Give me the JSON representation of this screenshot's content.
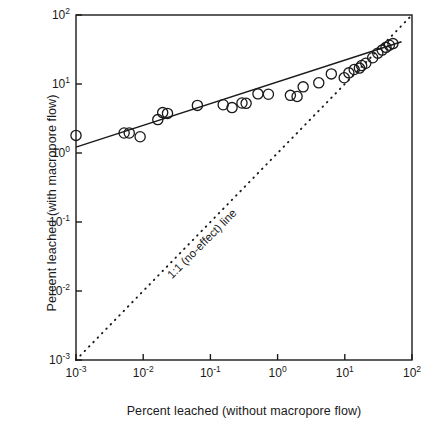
{
  "chart_data": {
    "type": "scatter",
    "title": "",
    "xlabel": "Percent leached (without macropore flow)",
    "ylabel": "Percent leached (with macropore flow)",
    "xscale": "log",
    "yscale": "log",
    "xlim": [
      0.001,
      100
    ],
    "ylim": [
      0.001,
      100
    ],
    "grid": false,
    "legend": false,
    "xticks": [
      "10-3",
      "10-2",
      "10-1",
      "100",
      "101",
      "102"
    ],
    "xtick_labels": [
      {
        "mant": "10",
        "exp": "-3"
      },
      {
        "mant": "10",
        "exp": "-2"
      },
      {
        "mant": "10",
        "exp": "-1"
      },
      {
        "mant": "10",
        "exp": "0"
      },
      {
        "mant": "10",
        "exp": "1"
      },
      {
        "mant": "10",
        "exp": "2"
      }
    ],
    "ytick_labels": [
      {
        "mant": "10",
        "exp": "2"
      },
      {
        "mant": "10",
        "exp": "1"
      },
      {
        "mant": "10",
        "exp": "0"
      },
      {
        "mant": "10",
        "exp": "-1"
      },
      {
        "mant": "10",
        "exp": "-2"
      },
      {
        "mant": "10",
        "exp": "-3"
      }
    ],
    "marker": "open-circle",
    "marker_color": "#1a1a1a",
    "points": [
      {
        "x": 0.001,
        "y": 1.8
      },
      {
        "x": 0.0052,
        "y": 1.95
      },
      {
        "x": 0.0062,
        "y": 1.95
      },
      {
        "x": 0.009,
        "y": 1.72
      },
      {
        "x": 0.0165,
        "y": 3.05
      },
      {
        "x": 0.0195,
        "y": 3.85
      },
      {
        "x": 0.023,
        "y": 3.75
      },
      {
        "x": 0.064,
        "y": 4.9
      },
      {
        "x": 0.155,
        "y": 5.0
      },
      {
        "x": 0.21,
        "y": 4.55
      },
      {
        "x": 0.295,
        "y": 5.3
      },
      {
        "x": 0.34,
        "y": 5.25
      },
      {
        "x": 0.51,
        "y": 7.2
      },
      {
        "x": 0.73,
        "y": 7.1
      },
      {
        "x": 1.55,
        "y": 6.85
      },
      {
        "x": 1.95,
        "y": 6.6
      },
      {
        "x": 2.4,
        "y": 9.1
      },
      {
        "x": 4.1,
        "y": 10.4
      },
      {
        "x": 6.3,
        "y": 14.0
      },
      {
        "x": 9.8,
        "y": 12.3
      },
      {
        "x": 11.5,
        "y": 14.5
      },
      {
        "x": 13.8,
        "y": 16.2
      },
      {
        "x": 16.5,
        "y": 17.0
      },
      {
        "x": 17.8,
        "y": 18.5
      },
      {
        "x": 20.5,
        "y": 20.0
      },
      {
        "x": 26.0,
        "y": 24.0
      },
      {
        "x": 31.0,
        "y": 28.0
      },
      {
        "x": 36.0,
        "y": 31.0
      },
      {
        "x": 41.0,
        "y": 34.0
      },
      {
        "x": 46.0,
        "y": 36.5
      },
      {
        "x": 52.0,
        "y": 38.5
      }
    ],
    "lines": [
      {
        "name": "regression-line",
        "style": "solid",
        "x0": 0.001,
        "y0": 1.22,
        "x1": 70.0,
        "y1": 41.0
      },
      {
        "name": "one-to-one-line",
        "style": "dotted",
        "x0": 0.001,
        "y0": 0.001,
        "x1": 100.0,
        "y1": 100.0,
        "label": "1:1 (no-effect) line"
      }
    ],
    "annotations": [
      {
        "text": "1:1 (no-effect) line",
        "x": 0.06,
        "y": 0.06,
        "rotation": -45
      }
    ]
  }
}
